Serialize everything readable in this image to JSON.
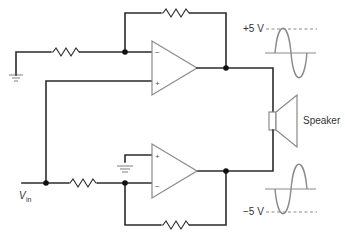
{
  "diagram": {
    "labels": {
      "positive_swing": "+5 V",
      "negative_swing": "−5 V",
      "speaker": "Speaker",
      "input_v": "V",
      "input_sub": "in"
    },
    "opamps": [
      {
        "id": "top",
        "inverting_sign": "−",
        "noninverting_sign": "+"
      },
      {
        "id": "bottom",
        "inverting_sign": "−",
        "noninverting_sign": "+"
      }
    ],
    "colors": {
      "wire": "#2b2b2b",
      "component_outline": "#8a8a8a",
      "node": "#111111",
      "background": "#ffffff"
    }
  }
}
